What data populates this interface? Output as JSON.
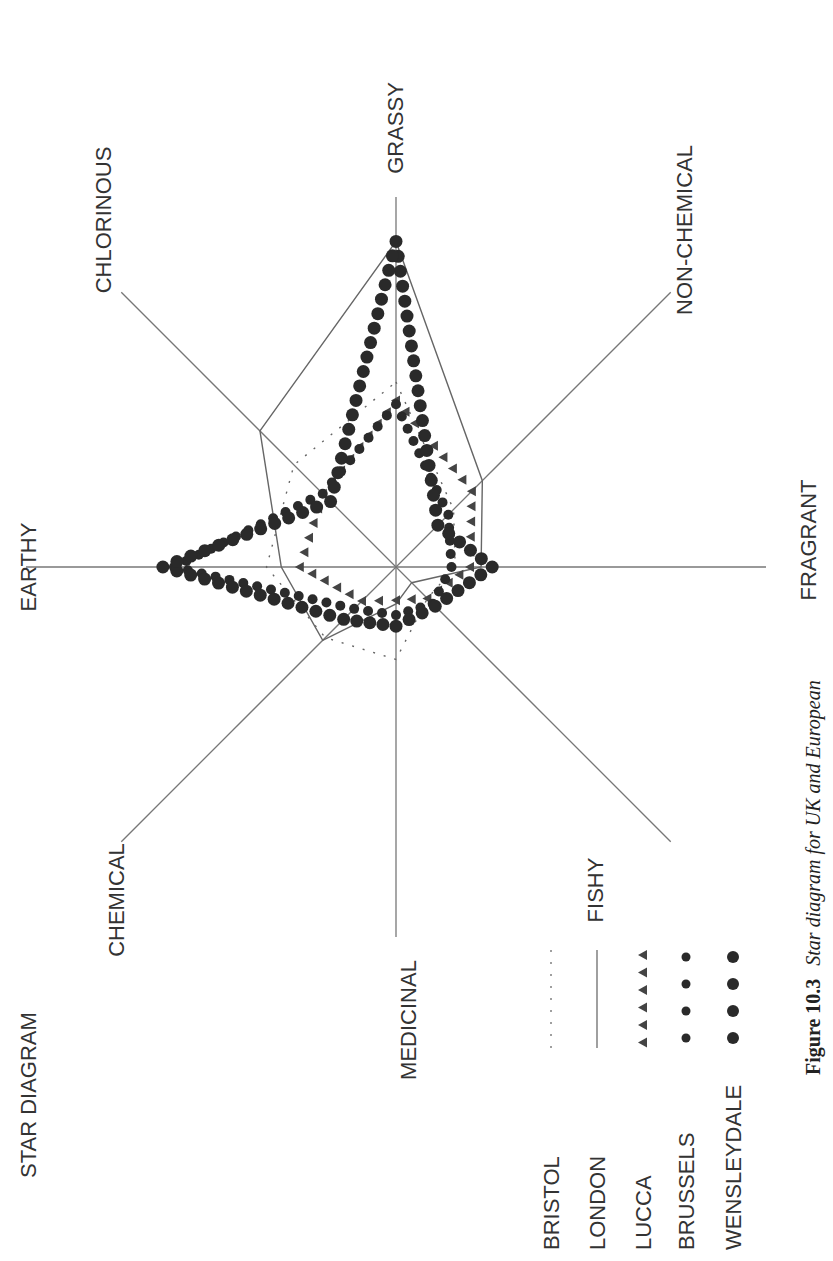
{
  "chart_data": {
    "type": "radar",
    "title": "STAR DIAGRAM",
    "caption": {
      "figure_label": "Figure 10.3",
      "text": "Star diagram for UK and European"
    },
    "orientation": "rotated 90° clockwise (text reads bottom-to-top)",
    "center_px": [
      396,
      567
    ],
    "axis_length_px": 370,
    "scale": [
      0,
      10
    ],
    "axes": [
      {
        "name": "GRASSY",
        "angle_deg": 0
      },
      {
        "name": "NON-CHEMICAL",
        "angle_deg": 45
      },
      {
        "name": "FRAGRANT",
        "angle_deg": 90
      },
      {
        "name": "FISHY",
        "angle_deg": 135
      },
      {
        "name": "MEDICINAL",
        "angle_deg": 180
      },
      {
        "name": "CHEMICAL",
        "angle_deg": 225
      },
      {
        "name": "EARTHY",
        "angle_deg": 270
      },
      {
        "name": "CHLORINOUS",
        "angle_deg": 315
      }
    ],
    "series": [
      {
        "name": "BRISTOL",
        "style": "dotted-line",
        "values": [
          5.0,
          2.2,
          1.6,
          1.2,
          2.5,
          2.7,
          3.5,
          3.9
        ]
      },
      {
        "name": "LONDON",
        "style": "solid-line",
        "values": [
          8.8,
          3.3,
          2.3,
          0.6,
          1.0,
          2.8,
          3.1,
          5.2
        ]
      },
      {
        "name": "LUCCA",
        "style": "triangles",
        "values": [
          4.5,
          2.9,
          2.0,
          1.2,
          0.9,
          1.3,
          2.6,
          2.8
        ]
      },
      {
        "name": "BRUSSELS",
        "style": "small-dots",
        "values": [
          4.4,
          2.0,
          1.5,
          1.4,
          1.3,
          1.6,
          6.0,
          2.8
        ]
      },
      {
        "name": "WENSLEYDALE",
        "style": "large-dots",
        "values": [
          8.8,
          1.6,
          2.6,
          1.5,
          1.6,
          2.0,
          6.3,
          2.5
        ]
      }
    ],
    "legend": {
      "position": "bottom-right (rotated)",
      "entries": [
        "BRISTOL",
        "LONDON",
        "LUCCA",
        "BRUSSELS",
        "WENSLEYDALE"
      ]
    },
    "grid": false
  }
}
